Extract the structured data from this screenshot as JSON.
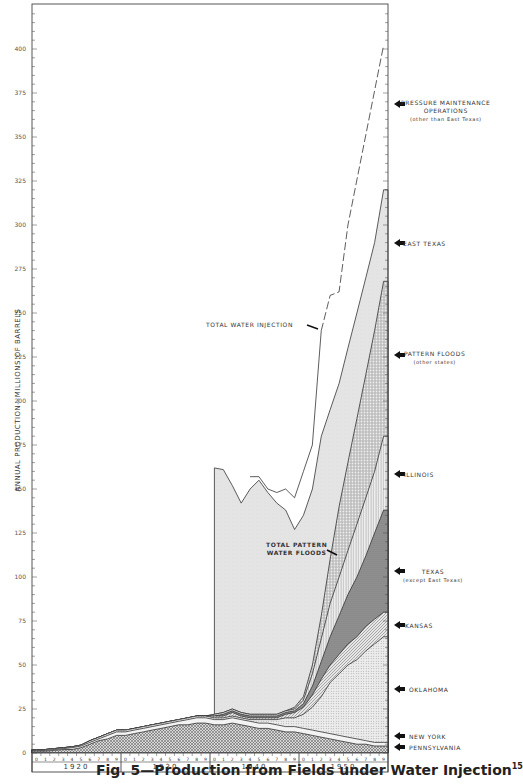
{
  "figure": {
    "caption": "Fig. 5—Production from Fields under Water Injection",
    "caption_ref": "15"
  },
  "chart_data": {
    "type": "area",
    "title": "Fig. 5—Production from Fields under Water Injection",
    "xlabel": "",
    "ylabel": "ANNUAL PRODUCTION—MILLIONS OF BARRELS",
    "ylim": [
      0,
      425
    ],
    "xlim": [
      1920,
      1960
    ],
    "yticks": [
      0,
      25,
      50,
      75,
      100,
      125,
      150,
      175,
      200,
      225,
      250,
      275,
      300,
      325,
      350,
      375,
      400
    ],
    "decade_labels": [
      "1920",
      "1930",
      "1940",
      "1950"
    ],
    "year_digits": [
      "0",
      "1",
      "2",
      "3",
      "4",
      "5",
      "6",
      "7",
      "8",
      "9"
    ],
    "stacked": true,
    "x": [
      1920,
      1921,
      1922,
      1923,
      1924,
      1925,
      1926,
      1927,
      1928,
      1929,
      1930,
      1931,
      1932,
      1933,
      1934,
      1935,
      1936,
      1937,
      1938,
      1939,
      1940,
      1941,
      1942,
      1943,
      1944,
      1945,
      1946,
      1947,
      1948,
      1949,
      1950,
      1951,
      1952,
      1953,
      1954,
      1955,
      1956,
      1957,
      1958,
      1959
    ],
    "series": [
      {
        "name": "PENNSYLVANIA",
        "pattern": "crosshatch",
        "top": [
          1,
          1,
          1.5,
          2,
          2,
          3,
          5,
          7,
          8,
          10,
          10,
          11,
          12,
          13,
          14,
          15,
          16,
          16,
          17,
          17,
          16,
          16,
          17,
          16,
          15,
          14,
          14,
          13,
          12,
          12,
          11,
          10,
          9,
          8,
          7,
          6,
          5,
          5,
          4,
          4
        ]
      },
      {
        "name": "NEW YORK",
        "pattern": "light",
        "top": [
          1.5,
          1.5,
          2,
          2.5,
          3,
          4,
          6,
          8,
          10,
          12,
          12,
          13,
          14,
          15,
          16,
          17,
          18,
          19,
          20,
          20,
          19,
          19,
          20,
          19,
          18,
          17,
          17,
          16,
          15,
          15,
          14,
          13,
          12,
          11,
          10,
          9,
          8,
          7,
          6,
          6
        ]
      },
      {
        "name": "OKLAHOMA",
        "pattern": "fine-dots",
        "top": [
          2,
          2,
          2.5,
          3,
          3.5,
          4.5,
          7,
          9,
          11,
          13,
          13,
          14,
          15,
          16,
          17,
          18,
          19,
          20,
          21,
          21,
          20,
          20,
          21,
          20,
          19,
          19,
          19,
          19,
          20,
          20,
          22,
          26,
          32,
          40,
          45,
          50,
          53,
          58,
          62,
          66
        ]
      },
      {
        "name": "KANSAS",
        "pattern": "diagonal-lines",
        "top": [
          2,
          2,
          2.5,
          3,
          3.5,
          4.5,
          7,
          9,
          11,
          13,
          13,
          14,
          15,
          16,
          17,
          18,
          19,
          20,
          21,
          21,
          21,
          21,
          23,
          21,
          20,
          20,
          20,
          20,
          22,
          23,
          26,
          33,
          42,
          50,
          56,
          62,
          66,
          72,
          76,
          80
        ]
      },
      {
        "name": "TEXAS (except East Texas)",
        "pattern": "dark-dots",
        "top": [
          2,
          2,
          2.5,
          3,
          3.5,
          4.5,
          7,
          9,
          11,
          13,
          13,
          14,
          15,
          16,
          17,
          18,
          19,
          20,
          21,
          21,
          21,
          22,
          24,
          22,
          21,
          21,
          21,
          21,
          23,
          24,
          28,
          38,
          52,
          66,
          78,
          90,
          100,
          112,
          125,
          138
        ]
      },
      {
        "name": "ILLINOIS",
        "pattern": "vertical-lines",
        "top": [
          2,
          2,
          2.5,
          3,
          3.5,
          4.5,
          7,
          9,
          11,
          13,
          13,
          14,
          15,
          16,
          17,
          18,
          19,
          20,
          21,
          21,
          22,
          23,
          25,
          23,
          22,
          22,
          22,
          22,
          24,
          25,
          30,
          45,
          65,
          85,
          100,
          115,
          130,
          145,
          160,
          180
        ]
      },
      {
        "name": "PATTERN FLOODS (other states)",
        "pattern": "coarse-dots",
        "top": [
          2,
          2,
          2.5,
          3,
          3.5,
          4.5,
          7,
          9,
          11,
          13,
          13,
          14,
          15,
          16,
          17,
          18,
          19,
          20,
          21,
          21,
          22,
          23,
          25,
          23,
          22,
          22,
          22,
          22,
          24,
          26,
          32,
          50,
          78,
          110,
          140,
          165,
          190,
          215,
          240,
          268
        ]
      },
      {
        "name": "EAST TEXAS",
        "pattern": "light-gray",
        "top": [
          null,
          null,
          null,
          null,
          null,
          null,
          null,
          null,
          null,
          null,
          null,
          null,
          null,
          null,
          null,
          null,
          null,
          null,
          null,
          null,
          162,
          161,
          152,
          142,
          150,
          155,
          148,
          142,
          138,
          127,
          135,
          150,
          180,
          195,
          210,
          230,
          250,
          270,
          290,
          320
        ]
      }
    ],
    "total_water_injection": {
      "name": "TOTAL WATER INJECTION",
      "style": "solid-then-dashed",
      "x": [
        1944,
        1945,
        1946,
        1947,
        1948,
        1949,
        1950,
        1951,
        1952,
        1953,
        1954,
        1955,
        1959
      ],
      "values": [
        157,
        157,
        150,
        148,
        150,
        145,
        160,
        175,
        240,
        260,
        262,
        300,
        402
      ],
      "dashed_from": 1952
    },
    "annotations": [
      {
        "text": "TOTAL WATER INJECTION",
        "x": 1947,
        "y": 244
      },
      {
        "text": "TOTAL PATTERN WATER FLOODS",
        "x": 1948,
        "y": 150
      }
    ],
    "legend_position": "right, arrow labels",
    "grid": false
  },
  "right_labels": [
    {
      "line1": "PRESSURE MAINTENANCE",
      "line2": "OPERATIONS",
      "line3": "(other than East Texas)"
    },
    {
      "line1": "EAST TEXAS"
    },
    {
      "line1": "PATTERN FLOODS",
      "line2": "(other states)"
    },
    {
      "line1": "ILLINOIS"
    },
    {
      "line1": "TEXAS",
      "line2": "(except East Texas)"
    },
    {
      "line1": "KANSAS"
    },
    {
      "line1": "OKLAHOMA"
    },
    {
      "line1": "NEW YORK"
    },
    {
      "line1": "PENNSYLVANIA"
    }
  ],
  "in_chart_labels": {
    "total_water_injection": "TOTAL WATER INJECTION",
    "total_pattern_1": "TOTAL PATTERN",
    "total_pattern_2": "WATER FLOODS"
  },
  "axis": {
    "ylabel": "ANNUAL PRODUCTION—MILLIONS OF BARRELS"
  }
}
